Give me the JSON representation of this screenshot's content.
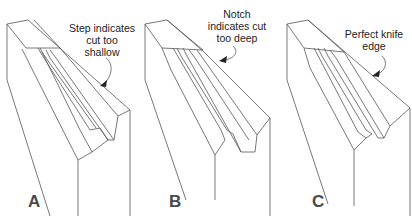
{
  "panels": [
    {
      "letter": "A",
      "caption_lines": [
        "Step indicates",
        "cut too",
        "shallow"
      ]
    },
    {
      "letter": "B",
      "caption_lines": [
        "Notch",
        "indicates cut",
        "too deep"
      ]
    },
    {
      "letter": "C",
      "caption_lines": [
        "Perfect knife",
        "edge"
      ]
    }
  ],
  "colors": {
    "line": "#555555",
    "text": "#222222",
    "letter": "#4a4a4a"
  }
}
